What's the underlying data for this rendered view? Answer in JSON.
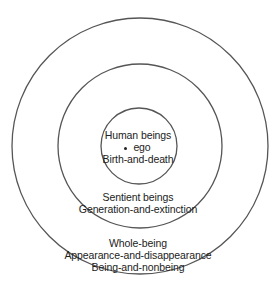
{
  "diagram": {
    "type": "concentric-circles",
    "rings": [
      {
        "name": "inner",
        "lines": [
          "Human beings",
          "ego",
          "Birth-and-death"
        ]
      },
      {
        "name": "middle",
        "lines": [
          "Sentient beings",
          "Generation-and-extinction"
        ]
      },
      {
        "name": "outer",
        "lines": [
          "Whole-being",
          "Appearance-and-disappearance",
          "Being-and-nonbeing"
        ]
      }
    ],
    "stroke_color": "#555555"
  }
}
